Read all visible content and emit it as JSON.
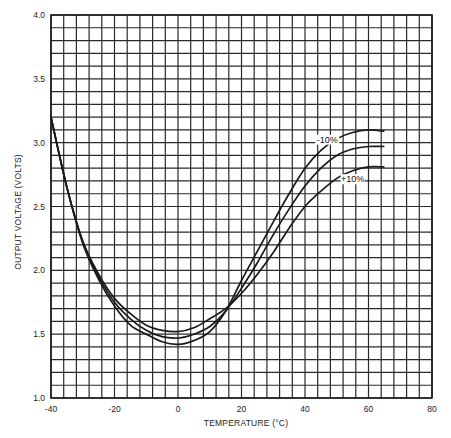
{
  "chart_data": {
    "type": "line",
    "title": "",
    "xlabel": "TEMPERATURE (°C)",
    "ylabel": "OUTPUT VOLTAGE (VOLTS)",
    "xlim": [
      -40,
      80
    ],
    "ylim": [
      1.0,
      4.0
    ],
    "grid": true,
    "grid_x_step": 4,
    "grid_y_step": 0.1,
    "x_ticks": [
      -40,
      -20,
      0,
      20,
      40,
      60,
      80
    ],
    "x_tick_labels": [
      "-40",
      "-20",
      "0",
      "20",
      "40",
      "60",
      "80"
    ],
    "y_ticks": [
      1.0,
      1.5,
      2.0,
      2.5,
      3.0,
      3.5,
      4.0
    ],
    "y_tick_labels": [
      "1.0",
      "1.5",
      "2.0",
      "2.5",
      "3.0",
      "3.5",
      "4.0"
    ],
    "annotations": [
      {
        "text": "-10%",
        "x": 47,
        "y": 3.0
      },
      {
        "text": "+10%",
        "x": 55,
        "y": 2.69
      }
    ],
    "series": [
      {
        "name": "nominal",
        "x": [
          -40,
          -35,
          -30,
          -25,
          -20,
          -15,
          -10,
          -5,
          0,
          5,
          10,
          15,
          20,
          25,
          30,
          35,
          40,
          45,
          50,
          55,
          60,
          65
        ],
        "values": [
          3.2,
          2.65,
          2.22,
          1.95,
          1.75,
          1.62,
          1.53,
          1.48,
          1.47,
          1.5,
          1.56,
          1.68,
          1.86,
          2.06,
          2.28,
          2.48,
          2.66,
          2.8,
          2.9,
          2.95,
          2.97,
          2.97
        ]
      },
      {
        "name": "-10%",
        "x": [
          -40,
          -35,
          -30,
          -25,
          -20,
          -15,
          -10,
          -5,
          0,
          5,
          10,
          15,
          20,
          25,
          30,
          35,
          40,
          45,
          50,
          55,
          60,
          65
        ],
        "values": [
          3.2,
          2.65,
          2.21,
          1.93,
          1.72,
          1.57,
          1.5,
          1.44,
          1.42,
          1.45,
          1.52,
          1.68,
          1.92,
          2.15,
          2.38,
          2.6,
          2.8,
          2.94,
          3.03,
          3.08,
          3.1,
          3.09
        ]
      },
      {
        "name": "+10%",
        "x": [
          -40,
          -35,
          -30,
          -25,
          -20,
          -15,
          -10,
          -5,
          0,
          5,
          10,
          15,
          20,
          25,
          30,
          35,
          40,
          45,
          50,
          55,
          60,
          65
        ],
        "values": [
          3.2,
          2.65,
          2.23,
          1.97,
          1.78,
          1.66,
          1.57,
          1.53,
          1.52,
          1.55,
          1.62,
          1.7,
          1.82,
          1.97,
          2.14,
          2.33,
          2.5,
          2.62,
          2.72,
          2.78,
          2.81,
          2.81
        ]
      }
    ]
  },
  "layout": {
    "plot_left": 51,
    "plot_right": 432,
    "plot_top": 15,
    "plot_bottom": 398,
    "line_color": "#1a1a1a",
    "grid_color": "#2a2a2a"
  }
}
